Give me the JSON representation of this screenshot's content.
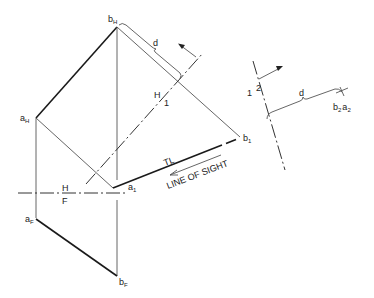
{
  "labels": {
    "b_H": {
      "main": "b",
      "sub": "H"
    },
    "a_H": {
      "main": "a",
      "sub": "H"
    },
    "a_1": {
      "main": "a",
      "sub": "1"
    },
    "b_1": {
      "main": "b",
      "sub": "1"
    },
    "a_F": {
      "main": "a",
      "sub": "F"
    },
    "b_F": {
      "main": "b",
      "sub": "F"
    },
    "b2a2": {
      "b": "b",
      "b_sub": "2",
      "a": "a",
      "a_sub": "2"
    },
    "fold_hf_top": "H",
    "fold_hf_bottom": "F",
    "fold_h1_top": "H",
    "fold_h1_bottom": "1",
    "fold_12_left": "1",
    "fold_12_right": "2",
    "distance_top": "d",
    "distance_right": "d",
    "true_length": "TL",
    "line_of_sight": "LINE OF SIGHT"
  },
  "colors": {
    "ink": "#1a1a1a",
    "background": "#ffffff"
  }
}
